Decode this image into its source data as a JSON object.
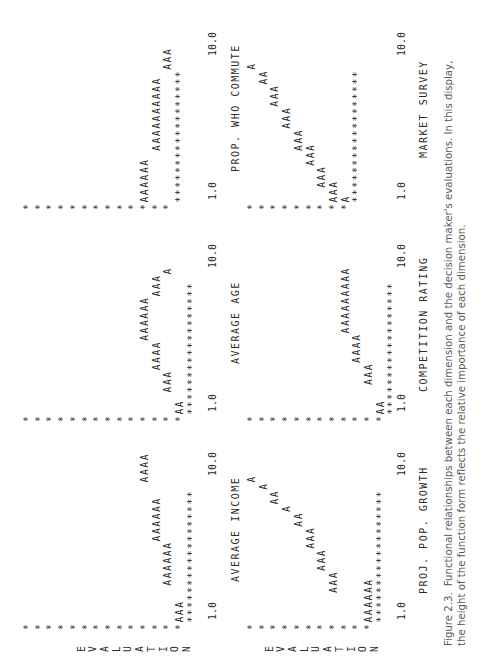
{
  "orientation": "page rotated 90 degrees counter-clockwise",
  "y_axis_label": "EVALUATION",
  "panels": [
    {
      "x_label": "AVERAGE INCOME",
      "x_min": "1.0",
      "x_max": "10.0",
      "plot": "*\n*\n*\n*\n*\n*\n*\n*\n*\n*\n*                   AAAA\n*           AAAAAA\n*     AAAAAA\n*AAA\n ******************"
    },
    {
      "x_label": "AVERAGE AGE",
      "x_min": "1.0",
      "x_max": "10.0",
      "plot": "*\n*\n*\n*\n*\n*\n*\n*\n*\n*\n*          AAAAAA\n*      AAAA      AAA\n*   AAA             A\n*AA\n ******************"
    },
    {
      "x_label": "PROP. WHO COMMUTE",
      "x_min": "1.0",
      "x_max": "10.0",
      "plot": "*\n*\n*\n*\n*\n*\n*\n*\n*\n*\n*AAAAAA\n*       AAAAAAAAAA\n*                  AAA\n ******************"
    },
    {
      "x_label": "PROJ. POP. GROWTH",
      "x_min": "1.0",
      "x_max": "10.0",
      "plot": "*                   A\n*                  A\n*                AA\n*               A\n*             AA\n*          AAA\n*       AAA\n*    AAA\n*\n*\n*AAAAAA\n ******************"
    },
    {
      "x_label": "COMPETITION RATING",
      "x_min": "1.0",
      "x_max": "10.0",
      "plot": "*\n*\n*\n*\n*\n*\n*\n*\n*           AAAAAAAAA\n*       AAAA\n*    AAA\n*AA\n ******************"
    },
    {
      "x_label": "MARKET SURVEY",
      "x_min": "1.0",
      "x_max": "10.0",
      "plot": "*                  A\n*                AA\n*             AAA\n*          AAA\n*       AAA\n*     AAA\n*  AAA\n*AAA\n*A\n ******************"
    }
  ],
  "caption": {
    "figure_number": "Figure 2.3.",
    "text": "Functional relationships between each dimension and the decision maker's evaluations. In this display, the height of the function form reflects the relative importance of each dimension."
  }
}
